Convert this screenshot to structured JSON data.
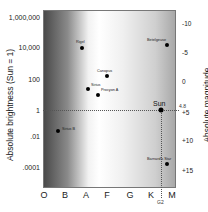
{
  "chart_data": {
    "type": "scatter",
    "title": "",
    "xlabel": "",
    "ylabel": "Absolute brightness (Sun = 1)",
    "y2label": "Absolute magnitude",
    "x_categories": [
      "O",
      "B",
      "A",
      "F",
      "G",
      "K",
      "M"
    ],
    "y_ticks": [
      "1,000,000",
      "10,000",
      "100",
      "1",
      ".01",
      ".0001"
    ],
    "y2_ticks": [
      "-10",
      "-5",
      "0",
      "+5",
      "+10",
      "+15"
    ],
    "yscale": "log",
    "ylim": [
      1e-05,
      1000000
    ],
    "points": [
      {
        "name": "Rigel",
        "class": "B",
        "brightness": 8000
      },
      {
        "name": "Betelgeuse",
        "class": "M",
        "brightness": 14000
      },
      {
        "name": "Canopus",
        "class": "F",
        "brightness": 14
      },
      {
        "name": "Sirius",
        "class": "A",
        "brightness": 23
      },
      {
        "name": "Procyon A",
        "class": "F",
        "brightness": 7
      },
      {
        "name": "Sun",
        "class": "G2",
        "brightness": 1,
        "magnitude": 4.8
      },
      {
        "name": "Sirius B",
        "class": "B",
        "brightness": 0.025
      },
      {
        "name": "Barnard's Star",
        "class": "M",
        "brightness": 0.0004
      }
    ],
    "annotations": [
      {
        "text": "4.8",
        "axis": "y2",
        "value": 4.8
      },
      {
        "text": "G2",
        "axis": "x",
        "value": "G2"
      }
    ],
    "reference_lines": [
      "horizontal dotted line at brightness 1",
      "vertical dotted line at G2"
    ],
    "background": "gradient representing star color/temperature",
    "grid": false
  },
  "axes": {
    "ylabel": "Absolute brightness (Sun = 1)",
    "y2label": "Absolute magnitude",
    "yticks": [
      {
        "label": "1,000,000",
        "y": 17
      },
      {
        "label": "10,000",
        "y": 47
      },
      {
        "label": "100",
        "y": 79
      },
      {
        "label": "1",
        "y": 110
      },
      {
        "label": ".01",
        "y": 136
      },
      {
        "label": ".0001",
        "y": 167
      }
    ],
    "y2ticks": [
      {
        "label": "-10",
        "y": 23
      },
      {
        "label": "-5",
        "y": 52
      },
      {
        "label": "0",
        "y": 81
      },
      {
        "label": "+5",
        "y": 112
      },
      {
        "label": "+10",
        "y": 140
      },
      {
        "label": "+15",
        "y": 170
      }
    ],
    "xticks": [
      {
        "label": "O",
        "x": 44
      },
      {
        "label": "B",
        "x": 65
      },
      {
        "label": "A",
        "x": 86
      },
      {
        "label": "F",
        "x": 107
      },
      {
        "label": "G",
        "x": 130
      },
      {
        "label": "K",
        "x": 151
      },
      {
        "label": "M",
        "x": 172
      }
    ],
    "g2_label": "G2",
    "mag_label": "4.8"
  },
  "stars": [
    {
      "name": "Rigel",
      "x": 82,
      "y": 48,
      "lx": 76,
      "ly": 40
    },
    {
      "name": "Betelgeuse",
      "x": 167,
      "y": 45,
      "lx": 147,
      "ly": 38
    },
    {
      "name": "Canopus",
      "x": 107,
      "y": 76,
      "lx": 97,
      "ly": 69
    },
    {
      "name": "Sirius",
      "x": 88,
      "y": 89,
      "lx": 91,
      "ly": 83
    },
    {
      "name": "Procyon A",
      "x": 98,
      "y": 95,
      "lx": 101,
      "ly": 88
    },
    {
      "name": "Sirius B",
      "x": 58,
      "y": 131,
      "lx": 62,
      "ly": 127
    },
    {
      "name": "Barnard's Star",
      "x": 167,
      "y": 164,
      "lx": 147,
      "ly": 157
    }
  ],
  "sun": {
    "name": "Sun",
    "x": 161,
    "y": 110,
    "lx": 155,
    "ly": 100
  }
}
